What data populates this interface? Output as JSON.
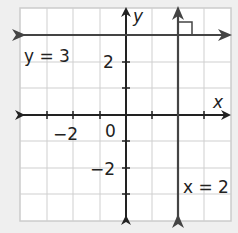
{
  "graph": {
    "x_axis_label": "x",
    "y_axis_label": "y",
    "tick_labels": {
      "x_neg2": "−2",
      "origin": "0",
      "y_pos2": "2",
      "y_neg2": "−2"
    },
    "lines": [
      {
        "label": "y = 3",
        "type": "horizontal",
        "value": 3
      },
      {
        "label": "x = 2",
        "type": "vertical",
        "value": 2
      }
    ],
    "right_angle_marker": true,
    "grid": {
      "xmin": -4,
      "xmax": 4,
      "ymin": -4,
      "ymax": 4
    },
    "colors": {
      "line": "#333333",
      "grid": "#cccccc",
      "background": "#ffffff"
    }
  }
}
